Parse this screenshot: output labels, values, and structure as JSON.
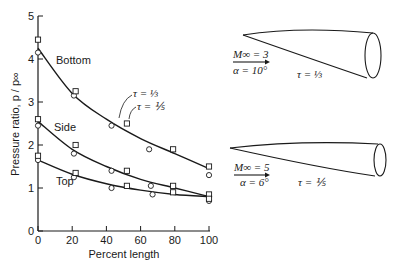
{
  "chart_data": {
    "type": "scatter",
    "title": "",
    "xlabel": "Percent length",
    "ylabel": "Pressure ratio, p / p∞",
    "xlim": [
      0,
      100
    ],
    "ylim": [
      0,
      5
    ],
    "xticks": [
      0,
      20,
      40,
      60,
      80,
      100
    ],
    "yticks": [
      0,
      1,
      2,
      3,
      4,
      5
    ],
    "grid": false,
    "curve_labels": [
      "Bottom",
      "Side",
      "Top"
    ],
    "annotations": [
      "τ = ⅓",
      "τ = ⅕"
    ],
    "series": [
      {
        "name": "Bottom, τ = ⅓ (circles)",
        "marker": "circle",
        "x": [
          0,
          21,
          43,
          65,
          100
        ],
        "y": [
          4.15,
          3.15,
          2.45,
          1.9,
          1.3
        ]
      },
      {
        "name": "Bottom, τ = ⅕ (squares)",
        "marker": "square",
        "x": [
          0,
          22,
          52,
          79,
          100
        ],
        "y": [
          4.45,
          3.25,
          2.5,
          1.9,
          1.5
        ]
      },
      {
        "name": "Side, τ = ⅓ (circles)",
        "marker": "circle",
        "x": [
          0,
          21,
          43,
          66,
          100
        ],
        "y": [
          2.45,
          1.8,
          1.4,
          1.05,
          0.8
        ]
      },
      {
        "name": "Side, τ = ⅕ (squares)",
        "marker": "square",
        "x": [
          0,
          22,
          52,
          79,
          100
        ],
        "y": [
          2.6,
          2.0,
          1.4,
          1.05,
          0.85
        ]
      },
      {
        "name": "Top, τ = ⅓ (circles)",
        "marker": "circle",
        "x": [
          0,
          21,
          43,
          67,
          100
        ],
        "y": [
          1.65,
          1.25,
          1.0,
          0.85,
          0.7
        ]
      },
      {
        "name": "Top, τ = ⅕ (squares)",
        "marker": "square",
        "x": [
          0,
          22,
          52,
          79,
          100
        ],
        "y": [
          1.75,
          1.35,
          1.05,
          0.9,
          0.75
        ]
      }
    ],
    "fit_curves": [
      {
        "name": "Bottom",
        "x": [
          0,
          20,
          40,
          60,
          80,
          100
        ],
        "y": [
          4.25,
          3.2,
          2.6,
          2.15,
          1.8,
          1.45
        ]
      },
      {
        "name": "Side",
        "x": [
          0,
          20,
          40,
          60,
          80,
          100
        ],
        "y": [
          2.55,
          1.9,
          1.5,
          1.2,
          1.0,
          0.8
        ]
      },
      {
        "name": "Top",
        "x": [
          0,
          20,
          40,
          60,
          80,
          100
        ],
        "y": [
          1.65,
          1.32,
          1.1,
          0.95,
          0.85,
          0.8
        ]
      }
    ]
  },
  "diagrams": [
    {
      "mach": "M∞ = 3",
      "alpha": "α = 10°",
      "tau": "τ = ⅓"
    },
    {
      "mach": "M∞ = 5",
      "alpha": "α = 6°",
      "tau": "τ = ⅕"
    }
  ]
}
